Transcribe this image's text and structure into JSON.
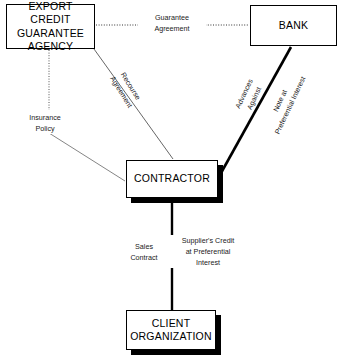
{
  "diagram": {
    "background_color": "#ffffff",
    "line_color": "#000000",
    "text_color": "#000000",
    "nodes": [
      {
        "id": "ecga",
        "label": "EXPORT CREDIT\nGUARANTEE\nAGENCY",
        "shadow": false
      },
      {
        "id": "bank",
        "label": "BANK",
        "shadow": false
      },
      {
        "id": "contractor",
        "label": "CONTRACTOR",
        "shadow": true
      },
      {
        "id": "client",
        "label": "CLIENT\nORGANIZATION",
        "shadow": true
      }
    ],
    "edges": [
      {
        "id": "guarantee",
        "from": "ecga",
        "to": "bank",
        "label": "Guarantee\nAgreement",
        "style": "dotted",
        "weight": "thin"
      },
      {
        "id": "recourse",
        "from": "ecga",
        "to": "contractor",
        "label": "Recourse\nAgreement",
        "style": "solid",
        "weight": "thin"
      },
      {
        "id": "insurance",
        "from": "ecga",
        "to": "contractor",
        "label": "Insurance\nPolicy",
        "style": "dotted-then-solid",
        "weight": "thin"
      },
      {
        "id": "advances",
        "from": "bank",
        "to": "contractor",
        "label": "Advances Against",
        "style": "solid",
        "weight": "thick"
      },
      {
        "id": "note",
        "from": "bank",
        "to": "contractor",
        "label": "Note at\nPreferential Interest",
        "style": "solid",
        "weight": "thick"
      },
      {
        "id": "sales",
        "from": "contractor",
        "to": "client",
        "label": "Sales\nContract",
        "style": "solid",
        "weight": "thick"
      },
      {
        "id": "supplier",
        "from": "contractor",
        "to": "client",
        "label": "Supplier's Credit\nat Preferential\nInterest",
        "style": "solid",
        "weight": "thick"
      }
    ]
  }
}
